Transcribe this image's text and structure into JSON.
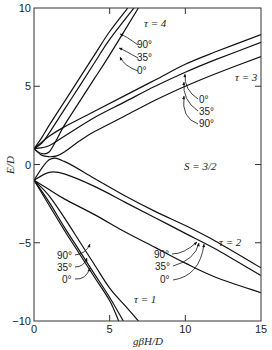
{
  "chart_data": {
    "type": "line",
    "title": "",
    "xlabel": "gβH/D",
    "ylabel": "E/D",
    "xlim": [
      0,
      15
    ],
    "ylim": [
      -10,
      10
    ],
    "xticks": [
      0,
      5,
      10,
      15
    ],
    "yticks": [
      -10,
      -5,
      0,
      5,
      10
    ],
    "grid": false,
    "annotation_spin": "S = 3/2",
    "series": [
      {
        "name": "τ = 4, 90°",
        "level": "tau4",
        "angle": "90°",
        "x": [
          0,
          0.5,
          1,
          2,
          3,
          4,
          5,
          6.2
        ],
        "y": [
          1,
          1.7,
          2.5,
          4.0,
          5.5,
          7.0,
          8.5,
          10
        ]
      },
      {
        "name": "τ = 4, 35°",
        "level": "tau4",
        "angle": "35°",
        "x": [
          0,
          0.5,
          1,
          2,
          3,
          4,
          5,
          6.6
        ],
        "y": [
          1,
          1.35,
          2.0,
          3.5,
          5.0,
          6.5,
          8.0,
          10
        ]
      },
      {
        "name": "τ = 4, 0°",
        "level": "tau4",
        "angle": "0°",
        "x": [
          0,
          0.5,
          1,
          1.5,
          2,
          3,
          4,
          5,
          6.9
        ],
        "y": [
          1,
          0.7,
          0.8,
          1.6,
          2.5,
          4.0,
          5.5,
          7.0,
          10
        ]
      },
      {
        "name": "τ = 3, 0°",
        "level": "tau3",
        "angle": "0°",
        "x": [
          0,
          1,
          2,
          4,
          6,
          8,
          10,
          12,
          15
        ],
        "y": [
          1,
          1.8,
          2.4,
          3.4,
          4.4,
          5.4,
          6.4,
          7.2,
          8.3
        ]
      },
      {
        "name": "τ = 3, 35°",
        "level": "tau3",
        "angle": "35°",
        "x": [
          0,
          1,
          2,
          4,
          6,
          8,
          10,
          12,
          15
        ],
        "y": [
          1,
          1.2,
          1.8,
          3.0,
          4.0,
          5.0,
          5.9,
          6.7,
          7.8
        ]
      },
      {
        "name": "τ = 3, 90°",
        "level": "tau3",
        "angle": "90°",
        "x": [
          0,
          0.5,
          1,
          1.5,
          2,
          3,
          4,
          6,
          8,
          10,
          12,
          15
        ],
        "y": [
          1,
          0.6,
          0.5,
          0.55,
          0.8,
          1.5,
          2.1,
          3.1,
          4.1,
          5.0,
          5.8,
          6.9
        ]
      },
      {
        "name": "τ = 2, 90°",
        "level": "tau2",
        "angle": "90°",
        "x": [
          0,
          1,
          2,
          4,
          6,
          8,
          10,
          12,
          15
        ],
        "y": [
          -1,
          0.3,
          0.2,
          -0.9,
          -2.0,
          -3.0,
          -3.9,
          -4.9,
          -6.6
        ]
      },
      {
        "name": "τ = 2, 35°",
        "level": "tau2",
        "angle": "35°",
        "x": [
          0,
          1,
          2,
          4,
          6,
          8,
          10,
          12,
          15
        ],
        "y": [
          -1,
          -0.5,
          -0.6,
          -1.4,
          -2.4,
          -3.4,
          -4.4,
          -5.4,
          -7.1
        ]
      },
      {
        "name": "τ = 2, 0°",
        "level": "tau2",
        "angle": "0°",
        "x": [
          0,
          1,
          2,
          4,
          6,
          8,
          10,
          12,
          15
        ],
        "y": [
          -1,
          -1.6,
          -2.2,
          -3.2,
          -4.3,
          -5.3,
          -6.3,
          -7.2,
          -8.2
        ]
      },
      {
        "name": "τ = 1, 90°",
        "level": "tau1",
        "angle": "90°",
        "x": [
          0,
          1,
          2,
          3,
          4,
          5,
          5.6
        ],
        "y": [
          -1,
          -2.6,
          -4.2,
          -5.7,
          -7.2,
          -8.7,
          -10
        ]
      },
      {
        "name": "τ = 1, 35°",
        "level": "tau1",
        "angle": "35°",
        "x": [
          0,
          1,
          2,
          3,
          4,
          5,
          5.9
        ],
        "y": [
          -1,
          -2.4,
          -4.0,
          -5.5,
          -7.0,
          -8.5,
          -10
        ]
      },
      {
        "name": "τ = 1, 0°",
        "level": "tau1",
        "angle": "0°",
        "x": [
          0,
          1,
          2,
          3,
          4,
          5,
          6,
          6.9
        ],
        "y": [
          -1,
          -2.0,
          -3.4,
          -4.9,
          -6.4,
          -7.9,
          -9.0,
          -10
        ]
      }
    ],
    "labels": {
      "tau4": "τ = 4",
      "tau3": "τ = 3",
      "tau2": "τ = 2",
      "tau1": "τ = 1",
      "spin": "S = 3/2"
    },
    "angle_labels": {
      "tau4": [
        "90°",
        "35°",
        "0°"
      ],
      "tau3": [
        "0°",
        "35°",
        "90°"
      ],
      "tau2": [
        "90°",
        "35°",
        "0°"
      ],
      "tau1": [
        "90°",
        "35°",
        "0°"
      ]
    }
  }
}
